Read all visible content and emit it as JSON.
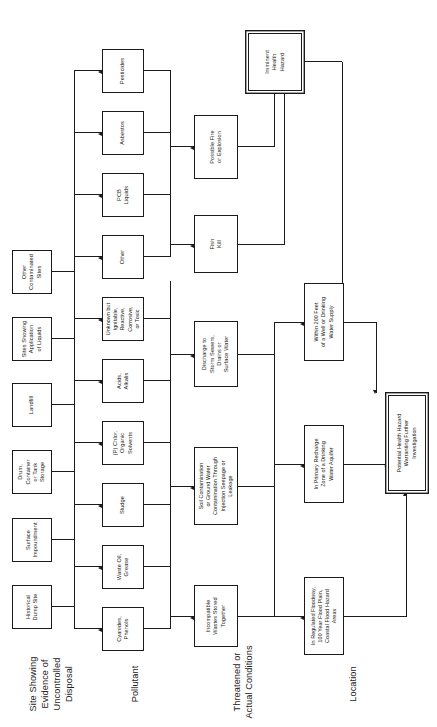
{
  "figure": {
    "orientation": "landscape-rotated",
    "line_color": "#1b1b1b",
    "background": "#ffffff"
  },
  "row_labels": [
    {
      "id": "row-site",
      "text": "Site Showing\nEvidence of\nUncontrolled\nDisposal"
    },
    {
      "id": "row-pollutant",
      "text": "Pollutant"
    },
    {
      "id": "row-condition",
      "text": "Threatened or\nActual Conditions"
    },
    {
      "id": "row-location",
      "text": "Location"
    }
  ],
  "sites": [
    {
      "id": "site-historical-dump",
      "label": "Historical\nDump Site"
    },
    {
      "id": "site-surface-impound",
      "label": "Surface\nImpoundment"
    },
    {
      "id": "site-drum-tank",
      "label": "Drum, Container\nor Tank Storage"
    },
    {
      "id": "site-landfill",
      "label": "Landfill"
    },
    {
      "id": "site-liquid-application",
      "label": "Sites Showing\nApplication\nof Liquids"
    },
    {
      "id": "site-other-contaminated",
      "label": "Other\nContaminated\nSites"
    }
  ],
  "pollutants": [
    {
      "id": "poll-cyanides",
      "label": "Cyanides,\nPhenols"
    },
    {
      "id": "poll-waste-oil",
      "label": "Waste Oil,\nGrease"
    },
    {
      "id": "poll-sludge",
      "label": "Sludge"
    },
    {
      "id": "poll-solvents",
      "label": "(P) Chlor.\nOrganic\nSolvents"
    },
    {
      "id": "poll-acids",
      "label": "Acids,\nAlkalis"
    },
    {
      "id": "poll-unknown",
      "label": "Unknown but\nIgnitable,\nReactive,\nCorrosive,\nor Toxic"
    },
    {
      "id": "poll-other",
      "label": "Other"
    },
    {
      "id": "poll-pcb",
      "label": "PCB\nLiquids"
    },
    {
      "id": "poll-asbestos",
      "label": "Asbestos"
    },
    {
      "id": "poll-pesticides",
      "label": "Pesticides"
    }
  ],
  "conditions": [
    {
      "id": "cond-incompatible",
      "label": "Incompatible\nWastes Stored\nTogether"
    },
    {
      "id": "cond-soil-gw",
      "label": "Soil Contamination\nor Ground Water\nContamination Through\nInjection Seepage or\nLeakage"
    },
    {
      "id": "cond-discharge",
      "label": "Discharge to\nStorm Sewers,\nDrains or\nSurface Water"
    },
    {
      "id": "cond-fish-kill",
      "label": "Fish\nKill"
    },
    {
      "id": "cond-fire",
      "label": "Possible Fire\nor Explosion"
    }
  ],
  "locations": [
    {
      "id": "loc-floodway",
      "label": "In Regulated Floodway,\n100 Year Flood Plain,\nCoastal Flood Hazard\nAreas"
    },
    {
      "id": "loc-recharge",
      "label": "In Primary Recharge\nZone of a Drinking\nWater Aquifer"
    },
    {
      "id": "loc-well-200ft",
      "label": "Within 200 Feet\nof a Well or Drinking\nWater Supply"
    }
  ],
  "outcomes": [
    {
      "id": "outcome-imminent",
      "label": "Imminent\nHealth\nHazard"
    },
    {
      "id": "outcome-potential",
      "label": "Potential Health Hazard\nWarranting Further\nInvestigation"
    }
  ]
}
